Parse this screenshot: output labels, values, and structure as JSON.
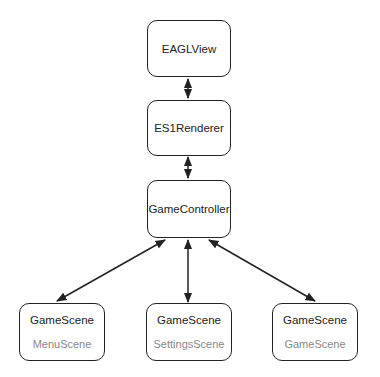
{
  "nodes": {
    "eaglview": {
      "title": "EAGLView"
    },
    "renderer": {
      "title": "ES1Renderer"
    },
    "controller": {
      "title": "GameController"
    },
    "scene1": {
      "title": "GameScene",
      "subtitle": "MenuScene"
    },
    "scene2": {
      "title": "GameScene",
      "subtitle": "SettingsScene"
    },
    "scene3": {
      "title": "GameScene",
      "subtitle": "GameScene"
    }
  },
  "edges": [
    {
      "from": "eaglview",
      "to": "renderer",
      "direction": "bidirectional"
    },
    {
      "from": "renderer",
      "to": "controller",
      "direction": "bidirectional"
    },
    {
      "from": "controller",
      "to": "scene1",
      "direction": "bidirectional"
    },
    {
      "from": "controller",
      "to": "scene2",
      "direction": "bidirectional"
    },
    {
      "from": "controller",
      "to": "scene3",
      "direction": "bidirectional"
    }
  ]
}
